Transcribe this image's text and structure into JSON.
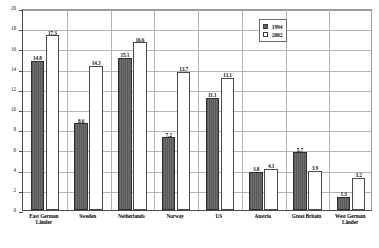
{
  "chart_data": {
    "type": "bar",
    "title": "",
    "subtitle": "",
    "xlabel": "",
    "ylabel": "",
    "ylim": [
      0,
      20
    ],
    "ytick_step": 2,
    "yticks": [
      "0",
      "2",
      "4",
      "6",
      "8",
      "10",
      "12",
      "14",
      "16",
      "18",
      "20"
    ],
    "grid": "horizontal",
    "legend_position": "top-right",
    "categories": [
      "East German Länder",
      "Sweden",
      "Netherlands",
      "Norway",
      "US",
      "Austria",
      "Great Britain",
      "West German Länder"
    ],
    "series": [
      {
        "name": "1994",
        "color": "#5e5e5e",
        "values": [
          14.8,
          8.6,
          15.1,
          7.2,
          11.1,
          3.8,
          5.7,
          1.3
        ],
        "labels": [
          "14.8",
          "8.6",
          "15.1",
          "7.2",
          "11.1",
          "3.8",
          "5.7",
          "1.3"
        ]
      },
      {
        "name": "2002",
        "color": "#ffffff",
        "values": [
          17.3,
          14.3,
          16.6,
          13.7,
          13.1,
          4.1,
          3.9,
          3.2
        ],
        "labels": [
          "17.3",
          "14.3",
          "16.6",
          "13.7",
          "13.1",
          "4.1",
          "3.9",
          "3.2"
        ]
      }
    ]
  },
  "legend": {
    "items": [
      {
        "label": "1994",
        "swatch": "filled-square"
      },
      {
        "label": "2002",
        "swatch": "empty-square"
      }
    ]
  }
}
